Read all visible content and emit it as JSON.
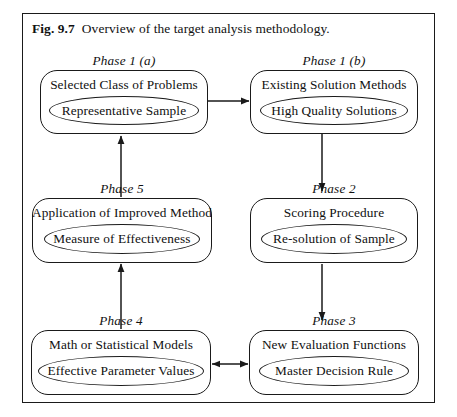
{
  "figure": {
    "label": "Fig. 9.7",
    "caption": "Overview of the target analysis methodology."
  },
  "nodes": [
    {
      "id": "phase-1a",
      "phase": "Phase 1 (a)",
      "title": "Selected Class of Problems",
      "ellipse": "Representative Sample"
    },
    {
      "id": "phase-1b",
      "phase": "Phase 1 (b)",
      "title": "Existing Solution Methods",
      "ellipse": "High Quality Solutions"
    },
    {
      "id": "phase-5",
      "phase": "Phase 5",
      "title": "Application of Improved Method",
      "ellipse": "Measure of Effectiveness"
    },
    {
      "id": "phase-2",
      "phase": "Phase 2",
      "title": "Scoring Procedure",
      "ellipse": "Re-solution of Sample"
    },
    {
      "id": "phase-4",
      "phase": "Phase 4",
      "title": "Math or Statistical Models",
      "ellipse": "Effective Parameter Values"
    },
    {
      "id": "phase-3",
      "phase": "Phase 3",
      "title": "New Evaluation Functions",
      "ellipse": "Master Decision Rule"
    }
  ],
  "connectors": [
    {
      "from": "phase-1a",
      "to": "phase-1b",
      "direction": "right"
    },
    {
      "from": "phase-1b",
      "to": "phase-2",
      "direction": "down"
    },
    {
      "from": "phase-2",
      "to": "phase-3",
      "direction": "down"
    },
    {
      "from": "phase-3",
      "to": "phase-4",
      "direction": "bidirectional"
    },
    {
      "from": "phase-4",
      "to": "phase-5",
      "direction": "up"
    },
    {
      "from": "phase-5",
      "to": "phase-1a",
      "direction": "up"
    }
  ],
  "style": {
    "line_color": "#1a1a1a",
    "background": "#ffffff"
  }
}
